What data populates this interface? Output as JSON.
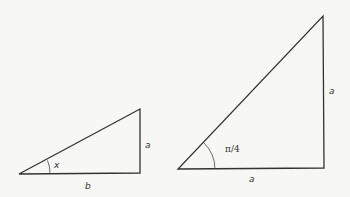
{
  "diagram": {
    "background": "#f7f7f5",
    "stroke_color": "#333333",
    "triangles": [
      {
        "id": "left-triangle",
        "description": "Right triangle with angle x, opposite side a, adjacent side b",
        "angle_label": "x",
        "opposite_label": "a",
        "adjacent_label": "b"
      },
      {
        "id": "right-triangle",
        "description": "Right isosceles triangle with angle pi/4 and both legs a",
        "angle_label": "π/4",
        "opposite_label": "a",
        "adjacent_label": "a"
      }
    ]
  }
}
